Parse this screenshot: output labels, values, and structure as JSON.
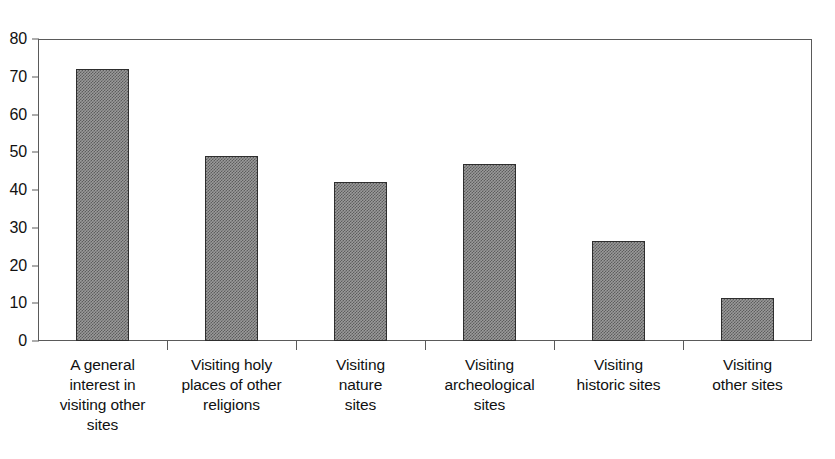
{
  "chart_data": {
    "type": "bar",
    "title": "",
    "xlabel": "",
    "ylabel": "",
    "ylim": [
      0,
      80
    ],
    "yticks": [
      0,
      10,
      20,
      30,
      40,
      50,
      60,
      70,
      80
    ],
    "grid": false,
    "legend": false,
    "categories": [
      "A general interest in visiting other sites",
      "Visiting holy places of other religions",
      "Visiting nature sites",
      "Visiting archeological sites",
      "Visiting historic sites",
      "Visiting other sites"
    ],
    "category_lines": [
      [
        "A general",
        "interest in",
        "visiting other",
        "sites"
      ],
      [
        "Visiting holy",
        "places of other",
        "religions"
      ],
      [
        "Visiting",
        "nature",
        "sites"
      ],
      [
        "Visiting",
        "archeological",
        "sites"
      ],
      [
        "Visiting",
        "historic sites"
      ],
      [
        "Visiting",
        "other sites"
      ]
    ],
    "values": [
      72,
      49,
      42,
      47,
      26.5,
      11.5
    ],
    "bar_fill_color": "#9a9a9a",
    "bar_edge_color": "#2e2e2e",
    "axis_color": "#5a5a5a",
    "text_color": "#111111",
    "background_color": "#ffffff"
  }
}
